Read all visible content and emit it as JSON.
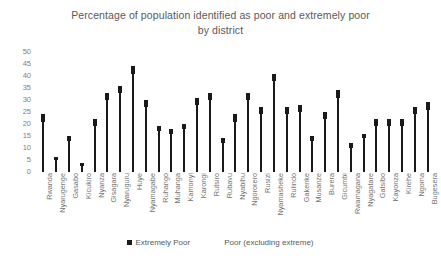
{
  "chart_data": {
    "type": "bar",
    "title": "Percentage of population identified as poor and extremely poor by district",
    "title_line1": "Percentage of population identified as poor and extremely poor",
    "title_line2": "by district",
    "xlabel": "",
    "ylabel": "",
    "ylim": [
      0,
      50
    ],
    "yticks": [
      50,
      45,
      40,
      35,
      30,
      25,
      20,
      15,
      10,
      5,
      0
    ],
    "grid": false,
    "legend_position": "bottom",
    "legend": [
      "Extremely Poor",
      "Poor (excluding extreme)"
    ],
    "categories": [
      "Rwanda",
      "Nyarugenge",
      "Gasabo",
      "Kicukiro",
      "Nyanza",
      "Gisagara",
      "Nyaruguru",
      "Huye",
      "Nyamagabe",
      "Ruhango",
      "Muhanga",
      "Kamonyi",
      "Karongi",
      "Rutsiro",
      "Rubavu",
      "Nyabihu",
      "Ngororero",
      "Rusizi",
      "Nyamasheke",
      "Rulindo",
      "Gakenke",
      "Musanze",
      "Burera",
      "Gicumbi",
      "Rwamagana",
      "Nyagatare",
      "Gatsibo",
      "Kayonza",
      "Kirehe",
      "Ngoma",
      "Bugesera"
    ],
    "series": [
      {
        "name": "Extremely Poor",
        "values": [
          24,
          6,
          15,
          3,
          22,
          33,
          36,
          44,
          30,
          19,
          18,
          20,
          31,
          33,
          14,
          24,
          33,
          27,
          41,
          27,
          28,
          15,
          25,
          34,
          12,
          16,
          22,
          22,
          22,
          27,
          29
        ]
      },
      {
        "name": "Poor (excluding extreme)",
        "values": [
          24,
          6,
          15,
          3,
          22,
          33,
          36,
          44,
          30,
          19,
          18,
          20,
          31,
          33,
          14,
          24,
          33,
          27,
          41,
          27,
          28,
          15,
          25,
          34,
          12,
          16,
          22,
          22,
          22,
          27,
          29
        ]
      }
    ],
    "values": [
      24,
      6,
      15,
      3,
      22,
      33,
      36,
      44,
      30,
      19,
      18,
      20,
      31,
      33,
      14,
      24,
      33,
      27,
      41,
      27,
      28,
      15,
      25,
      34,
      12,
      16,
      22,
      22,
      22,
      27,
      29
    ],
    "extreme_values": [
      21,
      5,
      13,
      2.5,
      19,
      30,
      33,
      41,
      27,
      17,
      16,
      18,
      28,
      30,
      12,
      21,
      30,
      24,
      38,
      24,
      25,
      13,
      22,
      31,
      10,
      14,
      19,
      19,
      19,
      24,
      26
    ]
  },
  "colors": {
    "bar": "#1a1a1a",
    "text": "#595959",
    "tick_text": "#808080",
    "background": "#ffffff"
  }
}
